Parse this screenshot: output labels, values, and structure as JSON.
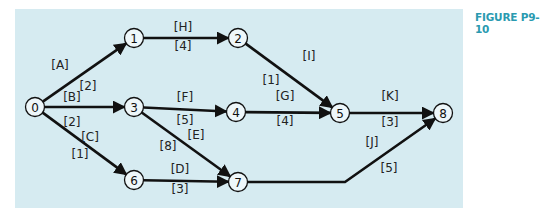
{
  "figure_label": "FIGURE P9-10",
  "colors": {
    "panel_bg": "#d6ebf1",
    "label_accent": "#2a9ab0",
    "line": "#111111"
  },
  "nodes": [
    {
      "id": "0",
      "x": 35,
      "y": 107
    },
    {
      "id": "1",
      "x": 134,
      "y": 38
    },
    {
      "id": "2",
      "x": 238,
      "y": 38
    },
    {
      "id": "3",
      "x": 134,
      "y": 107
    },
    {
      "id": "4",
      "x": 236,
      "y": 112
    },
    {
      "id": "5",
      "x": 340,
      "y": 113
    },
    {
      "id": "6",
      "x": 134,
      "y": 180
    },
    {
      "id": "7",
      "x": 238,
      "y": 182
    },
    {
      "id": "8",
      "x": 443,
      "y": 113
    }
  ],
  "activities": [
    {
      "name": "[A]",
      "duration": "[2]",
      "from": "0",
      "to": "1"
    },
    {
      "name": "[B]",
      "duration": "[2]",
      "from": "0",
      "to": "3"
    },
    {
      "name": "[C]",
      "duration": "[1]",
      "from": "0",
      "to": "6"
    },
    {
      "name": "[H]",
      "duration": "[4]",
      "from": "1",
      "to": "2"
    },
    {
      "name": "[I]",
      "duration": "[1]",
      "from": "2",
      "to": "5"
    },
    {
      "name": "[F]",
      "duration": "[5]",
      "from": "3",
      "to": "4"
    },
    {
      "name": "[E]",
      "duration": "[8]",
      "from": "3",
      "to": "7"
    },
    {
      "name": "[G]",
      "duration": "[4]",
      "from": "4",
      "to": "5"
    },
    {
      "name": "[K]",
      "duration": "[3]",
      "from": "5",
      "to": "8"
    },
    {
      "name": "[D]",
      "duration": "[3]",
      "from": "6",
      "to": "7"
    },
    {
      "name": "[J]",
      "duration": "[5]",
      "from": "7",
      "to": "8"
    }
  ]
}
